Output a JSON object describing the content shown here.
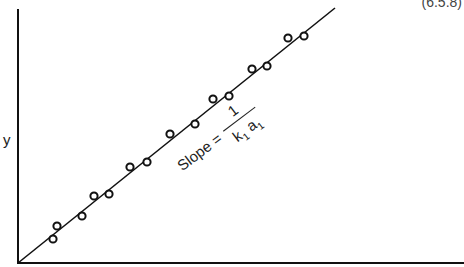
{
  "chart_data": {
    "type": "scatter",
    "title": "",
    "xlabel": "",
    "ylabel": "y",
    "equation_number": "(6.5.8)",
    "annotation": {
      "prefix": "Slope =",
      "numerator": "1",
      "denominator_k": "k",
      "denominator_k_sub": "1",
      "denominator_a": "a",
      "denominator_a_sub": "1"
    },
    "grid": false,
    "legend": null,
    "axes_pixels": {
      "x0": 18,
      "y0": 263,
      "x1": 462,
      "ytop": 9
    },
    "fit_line": {
      "from": [
        18,
        263
      ],
      "to": [
        335,
        8
      ]
    },
    "points": [
      [
        53,
        239
      ],
      [
        57,
        226
      ],
      [
        82,
        216
      ],
      [
        94,
        196
      ],
      [
        109,
        194
      ],
      [
        130,
        167
      ],
      [
        147,
        162
      ],
      [
        170,
        134
      ],
      [
        195,
        124
      ],
      [
        213,
        99
      ],
      [
        229,
        96
      ],
      [
        252,
        69
      ],
      [
        267,
        66
      ],
      [
        288,
        38
      ],
      [
        304,
        36
      ]
    ]
  }
}
